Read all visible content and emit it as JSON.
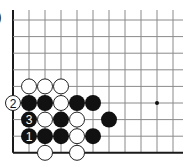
{
  "figure": {
    "label_fragment": ")"
  },
  "board": {
    "origin_x": 13,
    "origin_y": 20,
    "col_spacing": 16,
    "row_spacing": 16.6,
    "columns": 11,
    "rows": 9,
    "right_extent": 183,
    "top_extent": 10,
    "left_edge_is_border": true,
    "bottom_edge_is_border": true,
    "line_color": "#8a8a8a",
    "border_color": "#1a1a1a",
    "stone_radius": 8,
    "star_points": [
      {
        "col": 9,
        "row": 5
      }
    ]
  },
  "stones": [
    {
      "color": "white",
      "col": 1,
      "row": 4,
      "label": ""
    },
    {
      "color": "white",
      "col": 2,
      "row": 4,
      "label": ""
    },
    {
      "color": "white",
      "col": 3,
      "row": 4,
      "label": ""
    },
    {
      "color": "white",
      "col": 0,
      "row": 5,
      "label": "2"
    },
    {
      "color": "black",
      "col": 1,
      "row": 5,
      "label": ""
    },
    {
      "color": "black",
      "col": 2,
      "row": 5,
      "label": ""
    },
    {
      "color": "white",
      "col": 3,
      "row": 5,
      "label": ""
    },
    {
      "color": "black",
      "col": 4,
      "row": 5,
      "label": ""
    },
    {
      "color": "black",
      "col": 5,
      "row": 5,
      "label": ""
    },
    {
      "color": "black",
      "col": 1,
      "row": 6,
      "label": "3"
    },
    {
      "color": "white",
      "col": 2,
      "row": 6,
      "label": ""
    },
    {
      "color": "black",
      "col": 3,
      "row": 6,
      "label": ""
    },
    {
      "color": "white",
      "col": 4,
      "row": 6,
      "label": ""
    },
    {
      "color": "black",
      "col": 6,
      "row": 6,
      "label": ""
    },
    {
      "color": "black",
      "col": 1,
      "row": 7,
      "label": "1"
    },
    {
      "color": "black",
      "col": 2,
      "row": 7,
      "label": ""
    },
    {
      "color": "black",
      "col": 3,
      "row": 7,
      "label": ""
    },
    {
      "color": "white",
      "col": 4,
      "row": 7,
      "label": ""
    },
    {
      "color": "black",
      "col": 5,
      "row": 7,
      "label": ""
    },
    {
      "color": "white",
      "col": 2,
      "row": 8,
      "label": ""
    },
    {
      "color": "white",
      "col": 4,
      "row": 8,
      "label": ""
    }
  ]
}
